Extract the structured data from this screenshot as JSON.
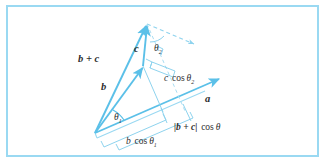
{
  "figure": {
    "background_color": "#ffffff",
    "frame_color": "#9ad9f2",
    "vector_color": "#5bc0e8",
    "guide_color": "#8ed3ee",
    "text_color": "#2d2d2d"
  },
  "labels": {
    "b_plus_c": "b + c",
    "b": "b",
    "c": "c",
    "a": "a",
    "theta1_base": "θ",
    "theta1_sub": "1",
    "theta2_base": "θ",
    "theta2_sub": "2",
    "c_cos_theta2_lead": "c",
    "c_cos_theta2_cos": "cos",
    "c_cos_theta2_sub": "2",
    "b_cos_theta1_lead": "b",
    "b_cos_theta1_cos": "cos",
    "b_cos_theta1_sub": "1",
    "bc_cos_theta_mag": "|b + c|",
    "bc_cos_theta_cos": "cos",
    "bc_cos_theta_sym": "θ"
  },
  "geometry": {
    "origin": {
      "x": 95,
      "y": 133
    },
    "mid_junction": {
      "x": 143,
      "y": 66
    },
    "apex": {
      "x": 147,
      "y": 24
    },
    "a_tip": {
      "x": 221,
      "y": 78
    },
    "dashed_tip": {
      "x": 196,
      "y": 43
    },
    "vectors": [
      {
        "name": "a",
        "from": "origin",
        "to": "a_tip",
        "arrow": true
      },
      {
        "name": "b",
        "from": "origin",
        "to": "mid_junction",
        "arrow": true
      },
      {
        "name": "c",
        "from": "mid_junction",
        "to": "apex",
        "arrow": true
      },
      {
        "name": "b + c",
        "from": "origin",
        "to": "apex",
        "arrow": true
      }
    ],
    "angles": [
      {
        "name": "theta1",
        "at": "origin",
        "between": [
          "b",
          "a"
        ]
      },
      {
        "name": "theta2",
        "at": "apex",
        "between": [
          "c",
          "dashed parallel to a"
        ]
      }
    ],
    "projections": [
      {
        "name": "b cos theta1",
        "segment": "origin to projection of b onto a"
      },
      {
        "name": "c cos theta2",
        "segment": "projection of c onto a direction"
      },
      {
        "name": "|b + c| cos theta",
        "segment": "origin to projection of b+c onto a"
      }
    ]
  }
}
